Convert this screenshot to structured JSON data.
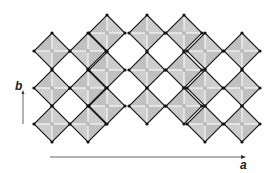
{
  "figure": {
    "axis_labels": {
      "a": "a",
      "b": "b"
    },
    "colors": {
      "edge": "#1a1a1a",
      "face_light": "#e4e4e4",
      "face_dark": "#9a9a9a",
      "hatch": "#888888",
      "vertex": "#111111"
    },
    "octahedron_half_size": 18,
    "octahedra": [
      {
        "cx": 52,
        "cy": 51
      },
      {
        "cx": 52,
        "cy": 88
      },
      {
        "cx": 52,
        "cy": 124
      },
      {
        "cx": 88,
        "cy": 51
      },
      {
        "cx": 88,
        "cy": 88
      },
      {
        "cx": 88,
        "cy": 124
      },
      {
        "cx": 107,
        "cy": 33
      },
      {
        "cx": 107,
        "cy": 70
      },
      {
        "cx": 107,
        "cy": 106
      },
      {
        "cx": 147,
        "cy": 33
      },
      {
        "cx": 147,
        "cy": 70
      },
      {
        "cx": 147,
        "cy": 106
      },
      {
        "cx": 184,
        "cy": 33
      },
      {
        "cx": 184,
        "cy": 70
      },
      {
        "cx": 184,
        "cy": 106
      },
      {
        "cx": 205,
        "cy": 51
      },
      {
        "cx": 205,
        "cy": 88
      },
      {
        "cx": 205,
        "cy": 124
      },
      {
        "cx": 242,
        "cy": 51
      },
      {
        "cx": 242,
        "cy": 88
      },
      {
        "cx": 242,
        "cy": 124
      }
    ],
    "arrows": {
      "a": {
        "x1": 50,
        "y1": 157,
        "x2": 243,
        "y2": 157
      },
      "b": {
        "x1": 23,
        "y1": 124,
        "x2": 23,
        "y2": 93
      }
    }
  }
}
